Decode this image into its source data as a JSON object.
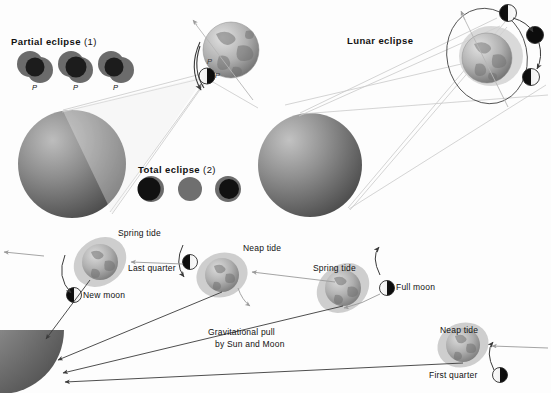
{
  "diagram": {
    "title_partial": "Partial eclipse",
    "title_partial_num": "(1)",
    "title_total": "Total eclipse",
    "title_total_num": "(2)",
    "title_lunar": "Lunar eclipse",
    "penumbra_marks": [
      "P",
      "P",
      "P"
    ],
    "earth_marks": [
      "P",
      "P"
    ],
    "tide_labels": {
      "spring_tide_left": "Spring tide",
      "spring_tide_right": "Spring tide",
      "neap_tide_left": "Neap tide",
      "neap_tide_right": "Neap tide",
      "new_moon": "New moon",
      "full_moon": "Full moon",
      "last_quarter": "Last quarter",
      "first_quarter": "First quarter",
      "gravitational_line1": "Gravitational pull",
      "gravitational_line2": "by Sun and Moon"
    },
    "colors": {
      "background": "#fdfdfd",
      "sun_light": "#b9b9b9",
      "sun_dark": "#4a4a4a",
      "moon_dark": "#0d0d0d",
      "moon_shadow": "#6e6e6e",
      "earth_light": "#d8d8d8",
      "earth_mid": "#9a9a9a",
      "earth_dark": "#5c5c5c",
      "halo": "#c3c3c3",
      "ray": "#c8c8c8",
      "arrow": "#3a3a3a",
      "text": "#111111"
    }
  }
}
